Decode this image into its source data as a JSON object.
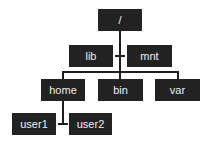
{
  "diagram": {
    "colors": {
      "node_fill": "#222222",
      "node_text": "#eeeeee",
      "edge": "#1e1e1e",
      "background": "#ffffff"
    },
    "nodes": [
      {
        "id": "root",
        "label": "/"
      },
      {
        "id": "lib",
        "label": "lib"
      },
      {
        "id": "mnt",
        "label": "mnt"
      },
      {
        "id": "home",
        "label": "home"
      },
      {
        "id": "bin",
        "label": "bin"
      },
      {
        "id": "var",
        "label": "var"
      },
      {
        "id": "user1",
        "label": "user1"
      },
      {
        "id": "user2",
        "label": "user2"
      }
    ],
    "edges": [
      [
        "root",
        "lib"
      ],
      [
        "root",
        "mnt"
      ],
      [
        "root",
        "home"
      ],
      [
        "root",
        "bin"
      ],
      [
        "root",
        "var"
      ],
      [
        "home",
        "user1"
      ],
      [
        "home",
        "user2"
      ]
    ]
  }
}
